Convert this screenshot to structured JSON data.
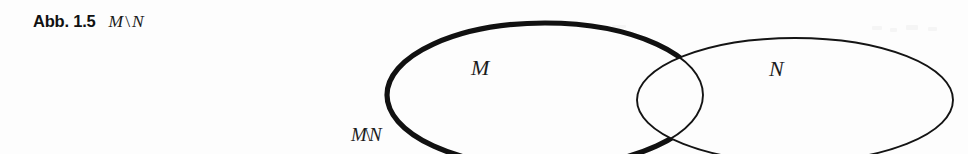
{
  "figure": {
    "caption_label": "Abb. 1.5",
    "caption_expression_left": "M",
    "caption_expression_operator": "\\",
    "caption_expression_right": "N",
    "background_color": "#fdfdfd",
    "stroke_color": "#111111"
  },
  "diagram": {
    "type": "venn-two-set-difference",
    "labels": {
      "set_m": "M",
      "set_n": "N",
      "difference_left": "M",
      "difference_operator": "\\",
      "difference_right": "N"
    },
    "ellipse_m": {
      "center_x": 545,
      "center_y": 95,
      "radius_x": 158,
      "radius_y": 72,
      "stroke_width_highlight": 5.2,
      "stroke_width_thin": 1.9,
      "highlighted": true
    },
    "ellipse_n": {
      "center_x": 795,
      "center_y": 100,
      "radius_x": 158,
      "radius_y": 62,
      "stroke_width_thin": 1.9,
      "highlighted": false
    },
    "intersection_points": [
      {
        "x": 655,
        "y": 44
      },
      {
        "x": 655,
        "y": 143
      }
    ]
  }
}
